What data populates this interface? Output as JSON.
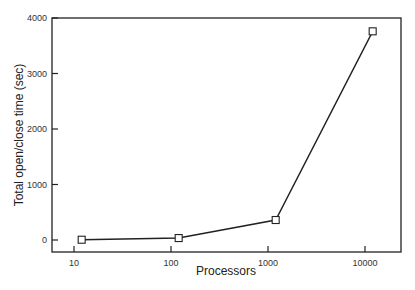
{
  "chart_data": {
    "type": "line",
    "title": "",
    "xlabel": "Processors",
    "ylabel": "Total open/close time (sec)",
    "xscale": "log",
    "xlim": [
      7,
      22000
    ],
    "ylim": [
      -200,
      4000
    ],
    "x_ticks": [
      10,
      100,
      1000,
      10000
    ],
    "x_tick_labels": [
      "10",
      "100",
      "1000",
      "10000"
    ],
    "y_ticks": [
      0,
      1000,
      2000,
      3000,
      4000
    ],
    "y_tick_labels": [
      "0",
      "1000",
      "2000",
      "3000",
      "4000"
    ],
    "grid": false,
    "legend": null,
    "series": [
      {
        "name": "open/close time",
        "marker": "open-square",
        "color": "#222222",
        "x": [
          12,
          120,
          1200,
          12000
        ],
        "values": [
          5,
          35,
          360,
          3760
        ]
      }
    ]
  },
  "layout": {
    "plot": {
      "left": 52,
      "top": 18,
      "right": 401,
      "bottom": 252
    },
    "y_zero_px": 240,
    "y_px_per_unit": 0.0555,
    "x_decade_px": 97,
    "x_10_px": 74
  }
}
